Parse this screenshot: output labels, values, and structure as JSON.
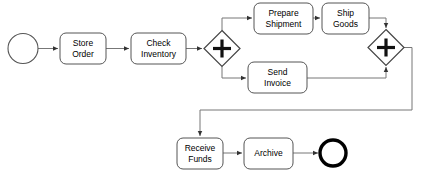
{
  "diagram": {
    "type": "bpmn-process-flow",
    "colors": {
      "background": "#ffffff",
      "shape_stroke": "#555555",
      "flow_stroke": "#777777",
      "gateway_stroke": "#444444",
      "end_event_stroke": "#000000",
      "text": "#000000"
    },
    "nodes": {
      "start_event": {
        "name": "start-event",
        "label": "",
        "shape": "circle"
      },
      "store_order": {
        "name": "task-store-order",
        "line1": "Store",
        "line2": "Order",
        "shape": "rounded-rect"
      },
      "check_inventory": {
        "name": "task-check-inventory",
        "line1": "Check",
        "line2": "Inventory",
        "shape": "rounded-rect"
      },
      "parallel_split": {
        "name": "gateway-parallel-split",
        "label": "+",
        "shape": "diamond"
      },
      "prepare_shipment": {
        "name": "task-prepare-shipment",
        "line1": "Prepare",
        "line2": "Shipment",
        "shape": "rounded-rect"
      },
      "ship_goods": {
        "name": "task-ship-goods",
        "line1": "Ship",
        "line2": "Goods",
        "shape": "rounded-rect"
      },
      "send_invoice": {
        "name": "task-send-invoice",
        "line1": "Send",
        "line2": "Invoice",
        "shape": "rounded-rect"
      },
      "parallel_join": {
        "name": "gateway-parallel-join",
        "label": "+",
        "shape": "diamond"
      },
      "receive_funds": {
        "name": "task-receive-funds",
        "line1": "Receive",
        "line2": "Funds",
        "shape": "rounded-rect"
      },
      "archive": {
        "name": "task-archive",
        "line1": "Archive",
        "line2": "",
        "shape": "rounded-rect"
      },
      "end_event": {
        "name": "end-event",
        "label": "",
        "shape": "thick-circle"
      }
    },
    "flows": [
      {
        "name": "flow-start-to-store-order",
        "from": "start_event",
        "to": "store_order",
        "label": ""
      },
      {
        "name": "flow-store-order-to-check-inventory",
        "from": "store_order",
        "to": "check_inventory",
        "label": ""
      },
      {
        "name": "flow-check-inventory-to-split",
        "from": "check_inventory",
        "to": "parallel_split",
        "label": ""
      },
      {
        "name": "flow-split-to-prepare-shipment",
        "from": "parallel_split",
        "to": "prepare_shipment",
        "label": ""
      },
      {
        "name": "flow-split-to-send-invoice",
        "from": "parallel_split",
        "to": "send_invoice",
        "label": ""
      },
      {
        "name": "flow-prepare-shipment-to-ship-goods",
        "from": "prepare_shipment",
        "to": "ship_goods",
        "label": ""
      },
      {
        "name": "flow-ship-goods-to-join",
        "from": "ship_goods",
        "to": "parallel_join",
        "label": ""
      },
      {
        "name": "flow-send-invoice-to-join",
        "from": "send_invoice",
        "to": "parallel_join",
        "label": ""
      },
      {
        "name": "flow-join-to-receive-funds",
        "from": "parallel_join",
        "to": "receive_funds",
        "label": ""
      },
      {
        "name": "flow-receive-funds-to-archive",
        "from": "receive_funds",
        "to": "archive",
        "label": ""
      },
      {
        "name": "flow-archive-to-end",
        "from": "archive",
        "to": "end_event",
        "label": ""
      }
    ]
  }
}
